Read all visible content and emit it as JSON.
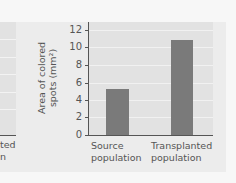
{
  "chart_data": {
    "type": "bar",
    "title": "",
    "xlabel": "",
    "ylabel": "Area of colored spots (mm²)",
    "ylabel_lines": [
      "Area of colored",
      "spots (mm²)"
    ],
    "categories": [
      "Source population",
      "Transplanted population"
    ],
    "category_lines": [
      [
        "Source",
        "population"
      ],
      [
        "Transplanted",
        "population"
      ]
    ],
    "values": [
      5.3,
      10.9
    ],
    "ylim": [
      0,
      12
    ],
    "yticks": [
      "0",
      "2",
      "4",
      "6",
      "8",
      "10",
      "12"
    ],
    "grid": true,
    "legend": null,
    "bar_color": "#7a7a7a",
    "plot_background": "#e2e2e2"
  },
  "left_panel_fragment": {
    "label_lines": [
      "ted",
      "n"
    ]
  }
}
